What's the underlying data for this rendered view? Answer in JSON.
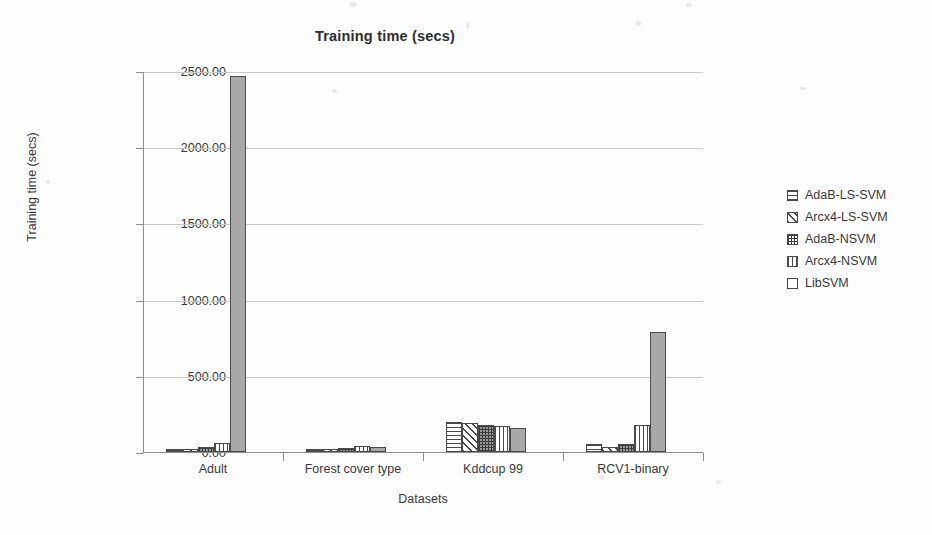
{
  "chart_data": {
    "type": "bar",
    "title": "Training time (secs)",
    "xlabel": "Datasets",
    "ylabel": "Training time (secs)",
    "categories": [
      "Adult",
      "Forest cover type",
      "Kddcup 99",
      "RCV1-binary"
    ],
    "ylim": [
      0,
      2500
    ],
    "yticks": [
      0,
      500,
      1000,
      1500,
      2000,
      2500
    ],
    "ytick_labels": [
      "0.00",
      "500.00",
      "1000.00",
      "1500.00",
      "2000.00",
      "2500.00"
    ],
    "grid": true,
    "legend_position": "right",
    "series": [
      {
        "name": "AdaB-LS-SVM",
        "pattern": "horizontal-lines",
        "values": [
          12,
          18,
          200,
          52
        ]
      },
      {
        "name": "Arcx4-LS-SVM",
        "pattern": "diagonal-hatch",
        "values": [
          14,
          20,
          190,
          30
        ]
      },
      {
        "name": "AdaB-NSVM",
        "pattern": "checkered",
        "values": [
          30,
          24,
          180,
          55
        ]
      },
      {
        "name": "Arcx4-NSVM",
        "pattern": "vertical-lines",
        "values": [
          60,
          38,
          170,
          180
        ]
      },
      {
        "name": "LibSVM",
        "pattern": "solid-gray",
        "values": [
          2470,
          35,
          160,
          790
        ]
      }
    ]
  },
  "colors": {
    "axis": "#8f8f8f",
    "grid": "#c9c9c9",
    "bar_outline": "#4a4a4a",
    "solid_fill": "#a8a8a8",
    "text": "#3a3a3a",
    "background": "#fdfdfd"
  }
}
